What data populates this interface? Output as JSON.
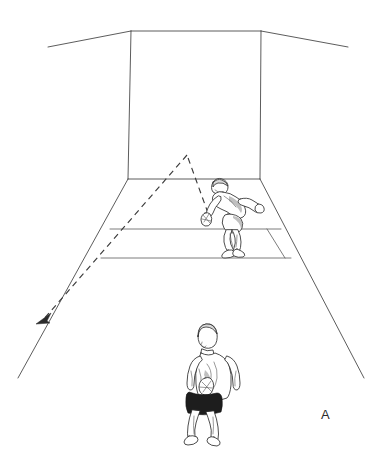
{
  "figure": {
    "panel_label": "A",
    "caption_text": "",
    "background_color": "#ffffff",
    "line_color": "#4a4a4a",
    "trajectory_color": "#3a3a3a",
    "view": "front-wall-perspective",
    "width": 382,
    "height": 450
  },
  "court": {
    "name": "racquetball-court",
    "front_wall": {
      "label": "front-wall",
      "top_left": [
        131,
        31
      ],
      "top_right": [
        261,
        31
      ],
      "bottom_left": [
        128,
        179
      ],
      "bottom_right": [
        260,
        179
      ]
    },
    "ceiling": {
      "label": "ceiling-edge",
      "left_end": [
        48,
        47
      ],
      "right_end": [
        348,
        47
      ]
    },
    "left_wall_floor_line": {
      "label": "left-sidewall-floor-line",
      "start": [
        128,
        179
      ],
      "end": [
        18,
        378
      ]
    },
    "right_wall_floor_line": {
      "label": "right-sidewall-floor-line",
      "start": [
        260,
        179
      ],
      "end": [
        364,
        378
      ]
    },
    "short_line": {
      "label": "short-line",
      "start": [
        110,
        229
      ],
      "end": [
        281,
        229
      ]
    },
    "service_line": {
      "label": "service-line",
      "start": [
        101,
        258
      ],
      "end": [
        291,
        258
      ]
    },
    "service_box_divider": {
      "label": "service-box-side-line",
      "start": [
        267,
        229
      ],
      "end": [
        285,
        258
      ]
    }
  },
  "trajectory": {
    "name": "ball-path",
    "style": "dashed",
    "apex": [
      187,
      155
    ],
    "wall_contact": [
      208,
      213
    ],
    "arrow_tip": [
      38,
      322
    ],
    "segments": [
      {
        "label": "ball-to-front-wall",
        "from": [
          208,
          213
        ],
        "to": [
          187,
          155
        ]
      },
      {
        "label": "front-wall-rebound",
        "from": [
          187,
          155
        ],
        "to": [
          38,
          322
        ]
      }
    ],
    "arrow_direction": "down-left"
  },
  "players": [
    {
      "id": "server",
      "label": "server-player",
      "pose": "crouched-striking-low-serve",
      "position": [
        222,
        212
      ],
      "head": [
        219,
        186
      ],
      "holding": "racquet",
      "facing": "front-wall",
      "shorts_color": "#1d1d1d"
    },
    {
      "id": "receiver",
      "label": "receiver-player",
      "pose": "standing-ready-back-view",
      "position": [
        204,
        375
      ],
      "head": [
        205,
        337
      ],
      "holding": "racquet",
      "facing": "front-wall-away-from-viewer",
      "shorts_color": "#1d1d1d"
    }
  ]
}
